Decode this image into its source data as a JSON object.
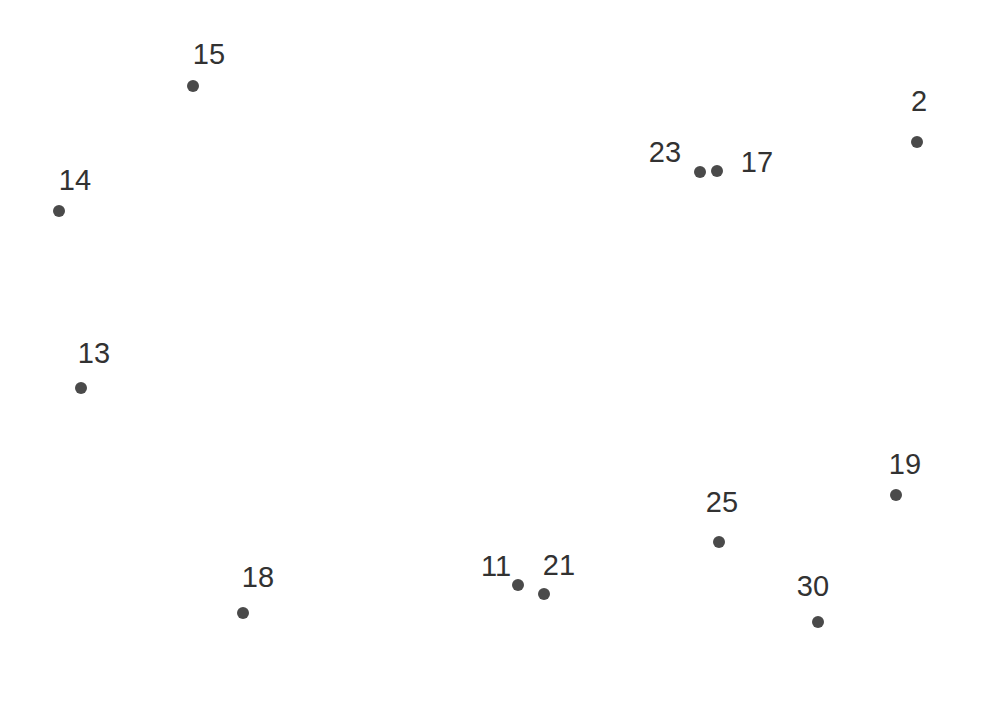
{
  "chart_data": {
    "type": "scatter",
    "title": "",
    "subtitle": "",
    "xlabel": "",
    "ylabel": "",
    "xlim": [
      0,
      983
    ],
    "ylim": [
      0,
      724
    ],
    "grid": false,
    "axes_visible": false,
    "legend": "none",
    "background_color": "#ffffff",
    "marker_color": "#4a4a4a",
    "marker_size_px": 12,
    "label_color": "#323232",
    "label_font_size_px": 29,
    "point_count": 12,
    "labels": [
      "15",
      "2",
      "23",
      "17",
      "14",
      "13",
      "19",
      "25",
      "11",
      "21",
      "18",
      "30"
    ],
    "points": [
      {
        "label": "15",
        "x": 193,
        "y": 86,
        "label_x": 209,
        "label_y": 54,
        "label_pos": "above-right"
      },
      {
        "label": "2",
        "x": 917,
        "y": 142,
        "label_x": 919,
        "label_y": 101,
        "label_pos": "above"
      },
      {
        "label": "23",
        "x": 700,
        "y": 172,
        "label_x": 665,
        "label_y": 152,
        "label_pos": "left"
      },
      {
        "label": "17",
        "x": 717,
        "y": 171,
        "label_x": 757,
        "label_y": 162,
        "label_pos": "right"
      },
      {
        "label": "14",
        "x": 59,
        "y": 211,
        "label_x": 75,
        "label_y": 180,
        "label_pos": "above-right"
      },
      {
        "label": "13",
        "x": 81,
        "y": 388,
        "label_x": 94,
        "label_y": 353,
        "label_pos": "above-right"
      },
      {
        "label": "19",
        "x": 896,
        "y": 495,
        "label_x": 905,
        "label_y": 464,
        "label_pos": "above"
      },
      {
        "label": "25",
        "x": 719,
        "y": 542,
        "label_x": 722,
        "label_y": 502,
        "label_pos": "above"
      },
      {
        "label": "11",
        "x": 518,
        "y": 585,
        "label_x": 496,
        "label_y": 566,
        "label_pos": "above-left"
      },
      {
        "label": "21",
        "x": 544,
        "y": 594,
        "label_x": 559,
        "label_y": 565,
        "label_pos": "above-right"
      },
      {
        "label": "18",
        "x": 243,
        "y": 613,
        "label_x": 258,
        "label_y": 577,
        "label_pos": "above-right"
      },
      {
        "label": "30",
        "x": 818,
        "y": 622,
        "label_x": 813,
        "label_y": 586,
        "label_pos": "above"
      }
    ]
  }
}
